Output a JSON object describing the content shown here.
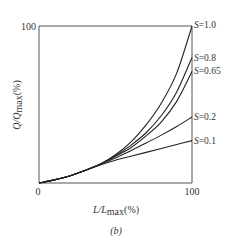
{
  "chart_data": {
    "type": "line",
    "title": "",
    "caption": "(b)",
    "xlabel": "L/L_max(%)",
    "ylabel": "Q/Q_max(%)",
    "xlim": [
      0,
      100
    ],
    "ylim": [
      0,
      100
    ],
    "x_ticks": [
      "0",
      "100"
    ],
    "y_ticks": [
      "100"
    ],
    "grid": false,
    "legend_position": "right-end-labels",
    "x": [
      0,
      10,
      20,
      30,
      40,
      50,
      60,
      70,
      80,
      90,
      100
    ],
    "series": [
      {
        "name": "S=1.0",
        "label": "S=1.0",
        "values": [
          0,
          2,
          4.5,
          8,
          12,
          18,
          26,
          37,
          51,
          70,
          100
        ]
      },
      {
        "name": "S=0.8",
        "label": "S=0.8",
        "values": [
          0,
          2,
          4.5,
          8,
          12,
          17.5,
          24,
          32,
          43,
          58,
          80
        ]
      },
      {
        "name": "S=0.65",
        "label": "S=0.65",
        "values": [
          0,
          2,
          4.5,
          8,
          12,
          17,
          22.5,
          30,
          39,
          52,
          71
        ]
      },
      {
        "name": "S=0.2",
        "label": "S=0.2",
        "values": [
          0,
          2,
          4.5,
          8,
          12,
          16,
          20.5,
          25.5,
          30.5,
          36,
          42
        ]
      },
      {
        "name": "S=0.1",
        "label": "S=0.1",
        "values": [
          0,
          2,
          4.5,
          8,
          11.5,
          14.5,
          17,
          19.5,
          22,
          24.5,
          27
        ]
      }
    ]
  },
  "labels": {
    "x_axis": "L/L",
    "x_axis_sub": "max",
    "x_axis_unit": "(%)",
    "y_axis": "Q/Q",
    "y_axis_sub": "max",
    "y_axis_unit": "(%)",
    "tick_x0": "0",
    "tick_x100": "100",
    "tick_y100": "100",
    "caption": "(b)"
  }
}
